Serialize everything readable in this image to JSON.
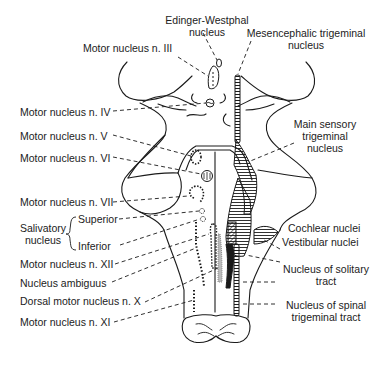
{
  "diagram": {
    "labels_left": {
      "motor_iii": "Motor nucleus n. III",
      "motor_iv": "Motor nucleus n. IV",
      "motor_v": "Motor nucleus n. V",
      "motor_vi": "Motor nucleus n. VI",
      "motor_vii": "Motor nucleus n. VII",
      "salivatory_line1": "Salivatory",
      "salivatory_line2": "nucleus",
      "salivatory_superior": "Superior",
      "salivatory_inferior": "Inferior",
      "motor_xii": "Motor nucleus n. XII",
      "ambiguus": "Nucleus ambiguus",
      "dorsal_motor_x": "Dorsal motor nucleus n. X",
      "motor_xi": "Motor nucleus n. XI"
    },
    "labels_top": {
      "edinger_line1": "Edinger-Westphal",
      "edinger_line2": "nucleus",
      "mesencephalic_line1": "Mesencephalic trigeminal",
      "mesencephalic_line2": "nucleus"
    },
    "labels_right": {
      "main_sensory_line1": "Main sensory",
      "main_sensory_line2": "trigeminal",
      "main_sensory_line3": "nucleus",
      "cochlear": "Cochlear nuclei",
      "vestibular": "Vestibular nuclei",
      "solitary_line1": "Nucleus of solitary",
      "solitary_line2": "tract",
      "spinal_trig_line1": "Nucleus of spinal",
      "spinal_trig_line2": "trigeminal tract"
    },
    "colors": {
      "ink": "#1a1a1a",
      "background": "#ffffff"
    }
  }
}
